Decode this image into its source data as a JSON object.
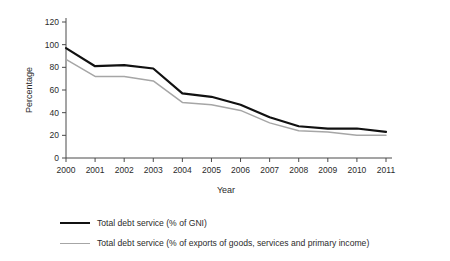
{
  "chart_data": {
    "type": "line",
    "title": "",
    "xlabel": "Year",
    "ylabel": "Percentage",
    "categories": [
      "2000",
      "2001",
      "2002",
      "2003",
      "2004",
      "2005",
      "2006",
      "2007",
      "2008",
      "2009",
      "2010",
      "2011"
    ],
    "x": [
      2000,
      2001,
      2002,
      2003,
      2004,
      2005,
      2006,
      2007,
      2008,
      2009,
      2010,
      2011
    ],
    "xlim": [
      2000,
      2011
    ],
    "ylim": [
      0,
      120
    ],
    "yticks": [
      0,
      20,
      40,
      60,
      80,
      100,
      120
    ],
    "ytick_labels": [
      "0",
      "20",
      "40",
      "60",
      "80",
      "100",
      "120"
    ],
    "grid": false,
    "legend_position": "below",
    "series": [
      {
        "name": "Total debt service (% of GNI)",
        "color": "#111111",
        "values": [
          97,
          81,
          82,
          79,
          57,
          54,
          47,
          36,
          28,
          26,
          26,
          23
        ]
      },
      {
        "name": "Total debt service (% of exports of goods, services and primary income)",
        "color": "#a6a6a6",
        "values": [
          87,
          72,
          72,
          68,
          49,
          47,
          42,
          31,
          24,
          23,
          20,
          20
        ]
      }
    ]
  },
  "axes": {
    "y_title": "Percentage",
    "x_title": "Year"
  },
  "legend": {
    "items": [
      {
        "label": "Total debt service (% of GNI)",
        "style": "black"
      },
      {
        "label": "Total debt service (% of exports of goods, services and primary income)",
        "style": "gray"
      }
    ]
  }
}
